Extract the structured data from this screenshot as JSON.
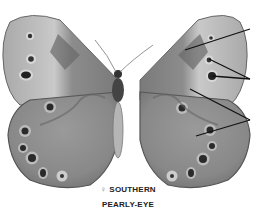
{
  "figure": {
    "caption": {
      "sex_symbol": "♀",
      "line1": "SOUTHERN",
      "line2": "PEARLY-EYE"
    },
    "callouts": [
      {
        "target": "forewing dark patch",
        "points": [
          [
            185,
            50
          ],
          [
            250,
            29
          ]
        ]
      },
      {
        "target": "forewing eyespot small",
        "points": [
          [
            209,
            59
          ],
          [
            250,
            79
          ]
        ]
      },
      {
        "target": "forewing eyespot large",
        "points": [
          [
            212,
            76
          ],
          [
            250,
            79
          ]
        ]
      },
      {
        "target": "forewing postmedian line",
        "points": [
          [
            190,
            89
          ],
          [
            250,
            120
          ]
        ]
      },
      {
        "target": "hindwing postmedian line",
        "points": [
          [
            196,
            136
          ],
          [
            250,
            120
          ]
        ]
      }
    ],
    "colors": {
      "background": "#ffffff",
      "wing_base": "#8a8a8a",
      "wing_light": "#c8c8c8",
      "wing_dark": "#5e5e5e",
      "eyespot": "#2a2a2a",
      "line": "#111111"
    }
  }
}
